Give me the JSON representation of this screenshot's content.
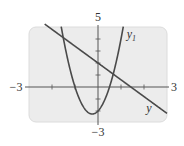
{
  "chart_data": {
    "type": "line",
    "title": "",
    "xlabel": "",
    "ylabel": "",
    "xlim": [
      -3,
      3
    ],
    "ylim": [
      -3,
      5
    ],
    "grid": false,
    "legend": "inline labels",
    "x_tick_step": 1,
    "y_tick_step": 1,
    "axis_labels": {
      "x_min": "−3",
      "x_max": "3",
      "y_max": "5",
      "y_min": "−3"
    },
    "series": [
      {
        "name": "y1",
        "label": "y",
        "label_sub": "1",
        "kind": "parabola",
        "equation": "y = 4x^2 + 2x - 2",
        "coefficients": {
          "a": 4,
          "b": 2,
          "c": -2
        },
        "label_pos": {
          "x": 1.25,
          "y": 4.1
        }
      },
      {
        "name": "y2",
        "label": "y",
        "label_sub": "",
        "kind": "line",
        "equation": "y = 2 - 1.4x",
        "coefficients": {
          "m": -1.4,
          "b": 2
        },
        "label_pos": {
          "x": 2.1,
          "y": -2.1
        }
      }
    ]
  },
  "style": {
    "panel_color": "#ececec",
    "panel_border": "#dcdcdc",
    "axis_color": "#555555",
    "curve_color": "#4a4a4a"
  }
}
